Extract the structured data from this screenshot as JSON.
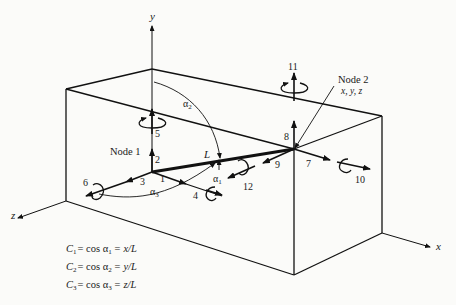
{
  "diagram": {
    "axes": {
      "x": "x",
      "y": "y",
      "z": "z"
    },
    "nodes": {
      "node1": "Node 1",
      "node2": "Node 2",
      "node2_coords": "x, y, z"
    },
    "element_length": "L",
    "angles": {
      "a1": "α",
      "a1_sub": "1",
      "a2": "α",
      "a2_sub": "2",
      "a3": "α",
      "a3_sub": "3"
    },
    "dof": [
      "1",
      "2",
      "3",
      "4",
      "5",
      "6",
      "7",
      "8",
      "9",
      "10",
      "11",
      "12"
    ],
    "equations": [
      {
        "lhs": "C",
        "sub": "1",
        "mid": "= cos α",
        "msub": "1",
        "rhs": "= x/L"
      },
      {
        "lhs": "C",
        "sub": "2",
        "mid": "= cos α",
        "msub": "2",
        "rhs": "= y/L"
      },
      {
        "lhs": "C",
        "sub": "3",
        "mid": "= cos α",
        "msub": "3",
        "rhs": "= z/L"
      }
    ],
    "colors": {
      "ink": "#111111",
      "background": "#fbfbf9"
    }
  }
}
